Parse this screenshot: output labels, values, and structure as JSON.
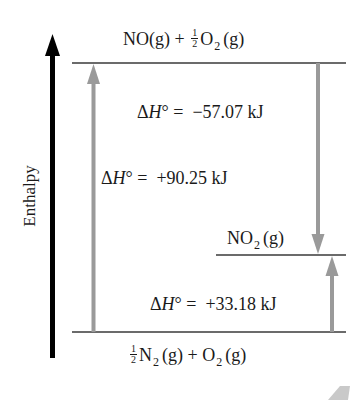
{
  "diagram": {
    "type": "enthalpy-level-diagram",
    "axis": {
      "label": "Enthalpy",
      "direction": "up"
    },
    "levels": {
      "top": {
        "species": "NO(g) + ½ O₂(g)",
        "parts": {
          "a": "NO(g) +",
          "frac_num": "1",
          "frac_den": "2",
          "b": "O",
          "b_sub": "2",
          "c": "(g)"
        }
      },
      "middle": {
        "species": "NO₂(g)",
        "parts": {
          "a": "NO",
          "a_sub": "2",
          "b": "(g)"
        }
      },
      "bottom": {
        "species": "½ N₂(g) + O₂(g)",
        "parts": {
          "frac_num": "1",
          "frac_den": "2",
          "a": "N",
          "a_sub": "2",
          "b": "(g) + O",
          "b_sub": "2",
          "c": "(g)"
        }
      }
    },
    "transitions": [
      {
        "name": "formation-NO",
        "from": "bottom",
        "to": "top",
        "delta_label": "ΔH° = +90.25 kJ",
        "prefix": "Δ",
        "H": "H",
        "rest": "° =  +90.25 kJ",
        "value_kJ": 90.25
      },
      {
        "name": "NO-to-NO2",
        "from": "top",
        "to": "middle",
        "delta_label": "ΔH° = −57.07 kJ",
        "prefix": "Δ",
        "H": "H",
        "rest": "° =  −57.07 kJ",
        "value_kJ": -57.07
      },
      {
        "name": "formation-NO2",
        "from": "bottom",
        "to": "middle",
        "delta_label": "ΔH° = +33.18 kJ",
        "prefix": "Δ",
        "H": "H",
        "rest": "° =  +33.18 kJ",
        "value_kJ": 33.18
      }
    ],
    "colors": {
      "axis_arrow": "#000000",
      "level_line": "#3a3a3a",
      "transition_arrow": "#9a9a9a",
      "text": "#1a1a1a"
    }
  }
}
